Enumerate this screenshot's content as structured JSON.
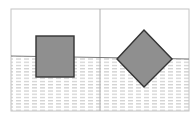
{
  "diagram": {
    "type": "buoyancy-illustration",
    "panels": [
      {
        "id": "left",
        "object": "square",
        "orientation": "upright"
      },
      {
        "id": "right",
        "object": "square",
        "orientation": "rotated-45"
      }
    ],
    "colors": {
      "frame": "#bdbdbd",
      "water_dash": "#b8b8b8",
      "object_fill": "#8e8e8e",
      "object_stroke": "#3a3a3a",
      "surface": "#555555",
      "background": "#ffffff"
    }
  }
}
